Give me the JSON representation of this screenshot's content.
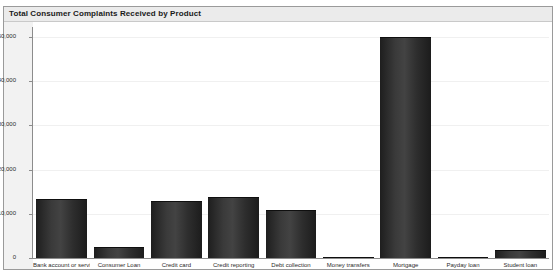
{
  "panel": {
    "title": "Total Consumer Complaints Received by Product"
  },
  "colors": {
    "bar": "#333333",
    "title_bar_bg": "#ebebeb",
    "panel_border": "#9a9a9a",
    "axis": "#8c8c8c",
    "gridline": "#f0f0f0",
    "plot_bg": "#ffffff",
    "text": "#2b2b2b"
  },
  "chart_data": {
    "type": "bar",
    "title": "Total Consumer Complaints Received by Product",
    "xlabel": "",
    "ylabel": "",
    "categories": [
      "Bank account or service",
      "Consumer Loan",
      "Credit card",
      "Credit reporting",
      "Debt collection",
      "Money transfers",
      "Mortgage",
      "Payday loan",
      "Student loan"
    ],
    "values": [
      13300,
      2500,
      12900,
      13900,
      10800,
      300,
      50000,
      200,
      1900
    ],
    "ylim": [
      0,
      50000
    ],
    "yticks": [
      0,
      10000,
      20000,
      30000,
      40000,
      50000
    ],
    "ytick_labels": [
      "0",
      "10,000",
      "20,000",
      "30,000",
      "40,000",
      "50,000"
    ],
    "grid": true,
    "legend": false
  }
}
